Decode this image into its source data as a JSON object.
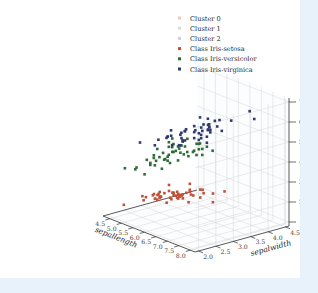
{
  "figure": {
    "background": "#ffffff",
    "page_background": "#e8f2fb"
  },
  "legend": {
    "entries": [
      {
        "label": "Cluster 0",
        "color": "#f0c9bc",
        "marker": "square"
      },
      {
        "label": "Cluster 1",
        "color": "#cfe3d3",
        "marker": "square"
      },
      {
        "label": "Cluster 2",
        "color": "#cdd0e0",
        "marker": "square"
      },
      {
        "label": "Class Iris-setosa",
        "color": "#c0503a",
        "marker": "square"
      },
      {
        "label": "Class Iris-versicolor",
        "color": "#2f6b3a",
        "marker": "square"
      },
      {
        "label": "Class Iris-virginica",
        "color": "#2e3a6e",
        "marker": "square"
      }
    ]
  },
  "chart_data": {
    "type": "scatter",
    "projection": "3d",
    "title": "",
    "xlabel": "sepallength",
    "ylabel": "sepalwidth",
    "zlabel": "petallength",
    "xlim": [
      4.2,
      8.2
    ],
    "ylim": [
      1.9,
      4.6
    ],
    "zlim": [
      0.8,
      7.2
    ],
    "xticks": [
      "4.5",
      "5.0",
      "5.5",
      "6.0",
      "6.5",
      "7.0",
      "7.5",
      "8.0"
    ],
    "yticks": [
      "2.0",
      "2.5",
      "3.0",
      "3.5",
      "4.0",
      "4.5"
    ],
    "zticks": [
      "1",
      "2",
      "3",
      "4",
      "5",
      "6",
      "7"
    ],
    "xtick_values": [
      4.5,
      5.0,
      5.5,
      6.0,
      6.5,
      7.0,
      7.5,
      8.0
    ],
    "ytick_values": [
      2.0,
      2.5,
      3.0,
      3.5,
      4.0,
      4.5
    ],
    "ztick_values": [
      1,
      2,
      3,
      4,
      5,
      6,
      7
    ],
    "grid": true,
    "legend_position": "upper right",
    "series": [
      {
        "name": "Class Iris-setosa",
        "color": "#c0503a",
        "points": [
          [
            5.1,
            3.5,
            1.4
          ],
          [
            4.9,
            3.0,
            1.4
          ],
          [
            4.7,
            3.2,
            1.3
          ],
          [
            4.6,
            3.1,
            1.5
          ],
          [
            5.0,
            3.6,
            1.4
          ],
          [
            5.4,
            3.9,
            1.7
          ],
          [
            4.6,
            3.4,
            1.4
          ],
          [
            5.0,
            3.4,
            1.5
          ],
          [
            4.4,
            2.9,
            1.4
          ],
          [
            4.9,
            3.1,
            1.5
          ],
          [
            5.4,
            3.7,
            1.5
          ],
          [
            4.8,
            3.4,
            1.6
          ],
          [
            4.8,
            3.0,
            1.4
          ],
          [
            4.3,
            3.0,
            1.1
          ],
          [
            5.8,
            4.0,
            1.2
          ],
          [
            5.7,
            4.4,
            1.5
          ],
          [
            5.4,
            3.9,
            1.3
          ],
          [
            5.1,
            3.5,
            1.4
          ],
          [
            5.7,
            3.8,
            1.7
          ],
          [
            5.1,
            3.8,
            1.5
          ],
          [
            5.4,
            3.4,
            1.7
          ],
          [
            5.1,
            3.7,
            1.5
          ],
          [
            4.6,
            3.6,
            1.0
          ],
          [
            5.1,
            3.3,
            1.7
          ],
          [
            4.8,
            3.4,
            1.9
          ],
          [
            5.0,
            3.0,
            1.6
          ],
          [
            5.0,
            3.4,
            1.6
          ],
          [
            5.2,
            3.5,
            1.5
          ],
          [
            5.2,
            3.4,
            1.4
          ],
          [
            4.7,
            3.2,
            1.6
          ],
          [
            4.8,
            3.1,
            1.6
          ],
          [
            5.4,
            3.4,
            1.5
          ],
          [
            5.2,
            4.1,
            1.5
          ],
          [
            5.5,
            4.2,
            1.4
          ],
          [
            4.9,
            3.1,
            1.5
          ],
          [
            5.0,
            3.2,
            1.2
          ],
          [
            5.5,
            3.5,
            1.3
          ],
          [
            4.9,
            3.6,
            1.4
          ],
          [
            4.4,
            3.0,
            1.3
          ],
          [
            5.1,
            3.4,
            1.5
          ],
          [
            5.0,
            3.5,
            1.3
          ],
          [
            4.5,
            2.3,
            1.3
          ],
          [
            4.4,
            3.2,
            1.3
          ],
          [
            5.0,
            3.5,
            1.6
          ],
          [
            5.1,
            3.8,
            1.9
          ],
          [
            4.8,
            3.0,
            1.4
          ],
          [
            5.1,
            3.8,
            1.6
          ],
          [
            4.6,
            3.2,
            1.4
          ],
          [
            5.3,
            3.7,
            1.5
          ],
          [
            5.0,
            3.3,
            1.4
          ]
        ]
      },
      {
        "name": "Class Iris-versicolor",
        "color": "#2f6b3a",
        "points": [
          [
            7.0,
            3.2,
            4.7
          ],
          [
            6.4,
            3.2,
            4.5
          ],
          [
            6.9,
            3.1,
            4.9
          ],
          [
            5.5,
            2.3,
            4.0
          ],
          [
            6.5,
            2.8,
            4.6
          ],
          [
            5.7,
            2.8,
            4.5
          ],
          [
            6.3,
            3.3,
            4.7
          ],
          [
            4.9,
            2.4,
            3.3
          ],
          [
            6.6,
            2.9,
            4.6
          ],
          [
            5.2,
            2.7,
            3.9
          ],
          [
            5.0,
            2.0,
            3.5
          ],
          [
            5.9,
            3.0,
            4.2
          ],
          [
            6.0,
            2.2,
            4.0
          ],
          [
            6.1,
            2.9,
            4.7
          ],
          [
            5.6,
            2.9,
            3.6
          ],
          [
            6.7,
            3.1,
            4.4
          ],
          [
            5.6,
            3.0,
            4.5
          ],
          [
            5.8,
            2.7,
            4.1
          ],
          [
            6.2,
            2.2,
            4.5
          ],
          [
            5.6,
            2.5,
            3.9
          ],
          [
            5.9,
            3.2,
            4.8
          ],
          [
            6.1,
            2.8,
            4.0
          ],
          [
            6.3,
            2.5,
            4.9
          ],
          [
            6.1,
            2.8,
            4.7
          ],
          [
            6.4,
            2.9,
            4.3
          ],
          [
            6.6,
            3.0,
            4.4
          ],
          [
            6.8,
            2.8,
            4.8
          ],
          [
            6.7,
            3.0,
            5.0
          ],
          [
            6.0,
            2.9,
            4.5
          ],
          [
            5.7,
            2.6,
            3.5
          ],
          [
            5.5,
            2.4,
            3.8
          ],
          [
            5.5,
            2.4,
            3.7
          ],
          [
            5.8,
            2.7,
            3.9
          ],
          [
            6.0,
            2.7,
            5.1
          ],
          [
            5.4,
            3.0,
            4.5
          ],
          [
            6.0,
            3.4,
            4.5
          ],
          [
            6.7,
            3.1,
            4.7
          ],
          [
            6.3,
            2.3,
            4.4
          ],
          [
            5.6,
            3.0,
            4.1
          ],
          [
            5.5,
            2.5,
            4.0
          ],
          [
            5.5,
            2.6,
            4.4
          ],
          [
            6.1,
            3.0,
            4.6
          ],
          [
            5.8,
            2.6,
            4.0
          ],
          [
            5.0,
            2.3,
            3.3
          ],
          [
            5.6,
            2.7,
            4.2
          ],
          [
            5.7,
            3.0,
            4.2
          ],
          [
            5.7,
            2.9,
            4.2
          ],
          [
            6.2,
            2.9,
            4.3
          ],
          [
            5.1,
            2.5,
            3.0
          ],
          [
            5.7,
            2.8,
            4.1
          ]
        ]
      },
      {
        "name": "Class Iris-virginica",
        "color": "#2e3a6e",
        "points": [
          [
            6.3,
            3.3,
            6.0
          ],
          [
            5.8,
            2.7,
            5.1
          ],
          [
            7.1,
            3.0,
            5.9
          ],
          [
            6.3,
            2.9,
            5.6
          ],
          [
            6.5,
            3.0,
            5.8
          ],
          [
            7.6,
            3.0,
            6.6
          ],
          [
            4.9,
            2.5,
            4.5
          ],
          [
            7.3,
            2.9,
            6.3
          ],
          [
            6.7,
            2.5,
            5.8
          ],
          [
            7.2,
            3.6,
            6.1
          ],
          [
            6.5,
            3.2,
            5.1
          ],
          [
            6.4,
            2.7,
            5.3
          ],
          [
            6.8,
            3.0,
            5.5
          ],
          [
            5.7,
            2.5,
            5.0
          ],
          [
            5.8,
            2.8,
            5.1
          ],
          [
            6.4,
            3.2,
            5.3
          ],
          [
            6.5,
            3.0,
            5.5
          ],
          [
            7.7,
            3.8,
            6.7
          ],
          [
            7.7,
            2.6,
            6.9
          ],
          [
            6.0,
            2.2,
            5.0
          ],
          [
            6.9,
            3.2,
            5.7
          ],
          [
            5.6,
            2.8,
            4.9
          ],
          [
            7.7,
            2.8,
            6.7
          ],
          [
            6.3,
            2.7,
            4.9
          ],
          [
            6.7,
            3.3,
            5.7
          ],
          [
            7.2,
            3.2,
            6.0
          ],
          [
            6.2,
            2.8,
            4.8
          ],
          [
            6.1,
            3.0,
            4.9
          ],
          [
            6.4,
            2.8,
            5.6
          ],
          [
            7.2,
            3.0,
            5.8
          ],
          [
            7.4,
            2.8,
            6.1
          ],
          [
            7.9,
            3.8,
            6.4
          ],
          [
            6.4,
            2.8,
            5.6
          ],
          [
            6.3,
            2.8,
            5.1
          ],
          [
            6.1,
            2.6,
            5.6
          ],
          [
            7.7,
            3.0,
            6.1
          ],
          [
            6.3,
            3.4,
            5.6
          ],
          [
            6.4,
            3.1,
            5.5
          ],
          [
            6.0,
            3.0,
            4.8
          ],
          [
            6.9,
            3.1,
            5.4
          ],
          [
            6.7,
            3.1,
            5.6
          ],
          [
            6.9,
            3.1,
            5.1
          ],
          [
            5.8,
            2.7,
            5.1
          ],
          [
            6.8,
            3.2,
            5.9
          ],
          [
            6.7,
            3.3,
            5.7
          ],
          [
            6.7,
            3.0,
            5.2
          ],
          [
            6.3,
            2.5,
            5.0
          ],
          [
            6.5,
            3.0,
            5.2
          ],
          [
            6.2,
            3.4,
            5.4
          ],
          [
            5.9,
            3.0,
            5.1
          ]
        ]
      }
    ]
  }
}
